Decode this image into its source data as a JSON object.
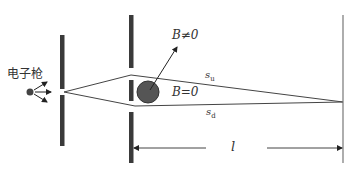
{
  "diagram": {
    "labels": {
      "electron_gun": "电子枪",
      "field_on": "B≠0",
      "field_off": "B=0",
      "path_upper": "s",
      "path_upper_sub": "u",
      "path_lower": "s",
      "path_lower_sub": "d",
      "distance": "l"
    },
    "colors": {
      "plate": "#3a3a3a",
      "coil": "#555555",
      "line": "#444444",
      "screen": "#777777"
    }
  }
}
